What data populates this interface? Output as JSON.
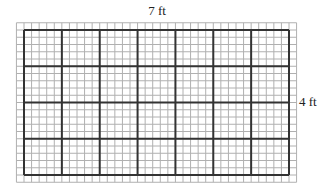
{
  "diagram": {
    "width_label": "7 ft",
    "height_label": "4 ft",
    "width_ft": 7,
    "height_ft": 4,
    "minor_divisions_per_ft": 5,
    "colors": {
      "major_line": "#333333",
      "minor_line": "#b0b0b0",
      "label": "#222222",
      "background": "#ffffff"
    }
  }
}
